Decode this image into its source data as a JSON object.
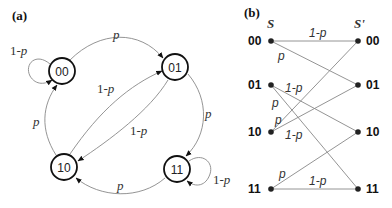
{
  "panel_a": {
    "label": "(a)",
    "nodes": [
      {
        "id": "00",
        "label": "00"
      },
      {
        "id": "01",
        "label": "01"
      },
      {
        "id": "10",
        "label": "10"
      },
      {
        "id": "11",
        "label": "11"
      }
    ],
    "edges": [
      {
        "from": "00",
        "to": "00",
        "label_prefix": "1-",
        "label_var": "p"
      },
      {
        "from": "00",
        "to": "01",
        "label_prefix": "",
        "label_var": "p"
      },
      {
        "from": "10",
        "to": "01",
        "label_prefix": "1-",
        "label_var": "p"
      },
      {
        "from": "01",
        "to": "10",
        "label_prefix": "1-",
        "label_var": "p"
      },
      {
        "from": "10",
        "to": "00",
        "label_prefix": "",
        "label_var": "p"
      },
      {
        "from": "01",
        "to": "11",
        "label_prefix": "",
        "label_var": "p"
      },
      {
        "from": "11",
        "to": "10",
        "label_prefix": "",
        "label_var": "p"
      },
      {
        "from": "11",
        "to": "11",
        "label_prefix": "1-",
        "label_var": "p"
      }
    ]
  },
  "panel_b": {
    "label": "(b)",
    "left_header": "S",
    "right_header": "S'",
    "left_states": [
      "00",
      "01",
      "10",
      "11"
    ],
    "right_states": [
      "00",
      "01",
      "10",
      "11"
    ],
    "transitions": [
      {
        "from": "00",
        "to": "00",
        "label": "1-p"
      },
      {
        "from": "00",
        "to": "01",
        "label": "p"
      },
      {
        "from": "01",
        "to": "10",
        "label": "1-p"
      },
      {
        "from": "01",
        "to": "11",
        "label": "p"
      },
      {
        "from": "10",
        "to": "00",
        "label": "p"
      },
      {
        "from": "10",
        "to": "01",
        "label": "1-p"
      },
      {
        "from": "11",
        "to": "10",
        "label": "p"
      },
      {
        "from": "11",
        "to": "11",
        "label": "1-p"
      }
    ]
  }
}
